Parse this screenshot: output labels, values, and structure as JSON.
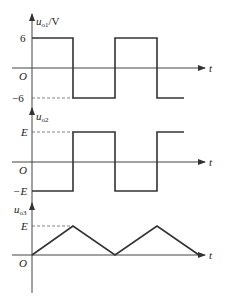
{
  "plots": [
    {
      "y_label_main": "u",
      "y_label_sub": "o1",
      "y_label_unit": "/V",
      "upper_tick": "6",
      "origin": "O",
      "lower_tick": "−6",
      "x_label": "t",
      "waveform": "square",
      "levels": [
        6,
        -6
      ]
    },
    {
      "y_label_main": "u",
      "y_label_sub": "o2",
      "upper_tick": "E",
      "origin": "O",
      "lower_tick": "−E",
      "x_label": "t",
      "waveform": "square-inverted",
      "levels": [
        "E",
        "-E"
      ]
    },
    {
      "y_label_main": "u",
      "y_label_sub": "o3",
      "upper_tick": "E",
      "origin": "O",
      "x_label": "t",
      "waveform": "triangle",
      "levels": [
        "E",
        0
      ]
    }
  ],
  "colors": {
    "line": "#333333",
    "axis": "#444444",
    "dash": "#666666"
  }
}
